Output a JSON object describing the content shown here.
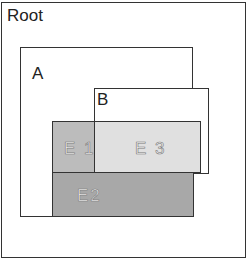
{
  "diagram": {
    "root": {
      "label": "Root"
    },
    "a": {
      "label": "A"
    },
    "b": {
      "label": "B"
    },
    "e1": {
      "label": "E 1",
      "color": "#b8b8b8"
    },
    "e2": {
      "label": "E2",
      "color": "#a6a6a6"
    },
    "e3": {
      "label": "E 3",
      "color": "#dedede"
    }
  }
}
